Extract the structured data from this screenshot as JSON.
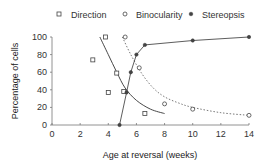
{
  "chart_data": {
    "type": "scatter",
    "title": "",
    "xlabel": "Age at reversal (weeks)",
    "ylabel": "Percentage of cells",
    "xlim": [
      0,
      14
    ],
    "ylim": [
      0,
      100
    ],
    "xticks": [
      0,
      2,
      4,
      6,
      8,
      10,
      12,
      14
    ],
    "yticks": [
      0,
      20,
      40,
      60,
      80,
      100
    ],
    "grid": false,
    "legend_position": "top",
    "series": [
      {
        "name": "Direction",
        "marker": "square-open",
        "line": "solid fitted curve",
        "points": [
          [
            2.9,
            74
          ],
          [
            3.8,
            100
          ],
          [
            4.0,
            37
          ],
          [
            4.6,
            59
          ],
          [
            5.1,
            38
          ],
          [
            6.6,
            13
          ]
        ],
        "fit": [
          [
            3.4,
            100
          ],
          [
            4.0,
            80
          ],
          [
            4.6,
            60
          ],
          [
            5.2,
            42
          ],
          [
            6.0,
            28
          ],
          [
            7.0,
            18
          ],
          [
            8.0,
            13
          ]
        ]
      },
      {
        "name": "Binocularity",
        "marker": "circle-open",
        "line": "dotted fitted curve",
        "points": [
          [
            5.2,
            100
          ],
          [
            6.2,
            65
          ],
          [
            8.0,
            24
          ],
          [
            10.0,
            18
          ],
          [
            14.0,
            11
          ]
        ],
        "fit": [
          [
            5.0,
            100
          ],
          [
            5.6,
            80
          ],
          [
            6.4,
            58
          ],
          [
            7.2,
            42
          ],
          [
            8.0,
            32
          ],
          [
            9.0,
            25
          ],
          [
            10.0,
            20
          ],
          [
            12.0,
            14
          ],
          [
            14.0,
            11
          ]
        ]
      },
      {
        "name": "Stereopsis",
        "marker": "circle-filled",
        "line": "solid connected",
        "points": [
          [
            4.8,
            0
          ],
          [
            5.3,
            37
          ],
          [
            5.6,
            60
          ],
          [
            6.0,
            80
          ],
          [
            6.6,
            91
          ],
          [
            10.0,
            96
          ],
          [
            14.0,
            100
          ]
        ]
      }
    ]
  },
  "legend": {
    "items": [
      {
        "label": "Direction",
        "marker": "square-open"
      },
      {
        "label": "Binocularity",
        "marker": "circle-open"
      },
      {
        "label": "Stereopsis",
        "marker": "circle-filled"
      }
    ]
  },
  "axes": {
    "x_title": "Age at reversal (weeks)",
    "y_title": "Percentage of cells",
    "x_ticks": [
      "0",
      "2",
      "4",
      "6",
      "8",
      "10",
      "12",
      "14"
    ],
    "y_ticks": [
      "0",
      "20",
      "40",
      "60",
      "80",
      "100"
    ]
  },
  "colors": {
    "axis": "#777777",
    "marker": "#444444",
    "line": "#333333"
  }
}
